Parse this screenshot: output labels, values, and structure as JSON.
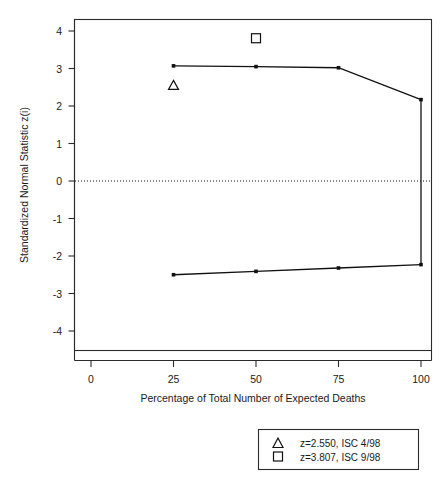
{
  "chart_data": {
    "type": "line",
    "title": "",
    "xlabel": "Percentage of Total Number of Expected Deaths",
    "ylabel": "Standardized Normal Statistic z(i)",
    "xlim": [
      -5,
      105
    ],
    "ylim": [
      -4.4,
      4.4
    ],
    "xticks": [
      0,
      25,
      50,
      75,
      100
    ],
    "xtick_labels": [
      "0",
      "25",
      "50",
      "75",
      "100"
    ],
    "yticks": [
      4,
      3,
      2,
      1,
      0,
      -1,
      -2,
      -3,
      -4
    ],
    "ytick_labels": [
      "4",
      "3",
      "2",
      "1",
      "0",
      "-1",
      "-2",
      "-3",
      "-4"
    ],
    "grid": false,
    "legend_position": "below-plot-right",
    "reference_line": {
      "name": "zero-line",
      "y": 0,
      "style": "dotted"
    },
    "series": [
      {
        "name": "Upper sequential boundary",
        "style": "line-with-points",
        "x": [
          25,
          50,
          75,
          100
        ],
        "values": [
          3.07,
          3.05,
          3.02,
          2.17
        ]
      },
      {
        "name": "Lower sequential boundary",
        "style": "line-with-points",
        "x": [
          25,
          50,
          75,
          100
        ],
        "values": [
          -2.5,
          -2.41,
          -2.32,
          -2.23
        ]
      },
      {
        "name": "Closing vertical boundary at 100%",
        "style": "vertical-connector",
        "x": [
          100,
          100
        ],
        "values": [
          2.17,
          -2.23
        ]
      }
    ],
    "annotations": [
      {
        "name": "observed-z-apr-1998",
        "marker": "triangle",
        "x": 25,
        "y": 2.55,
        "label": "z=2.550, ISC 4/98"
      },
      {
        "name": "observed-z-sep-1998",
        "marker": "square",
        "x": 50,
        "y": 3.807,
        "label": "z=3.807, ISC 9/98"
      }
    ],
    "legend": {
      "entries": [
        {
          "marker": "triangle",
          "label": "z=2.550, ISC 4/98"
        },
        {
          "marker": "square",
          "label": "z=3.807, ISC 9/98"
        }
      ]
    }
  },
  "axis": {
    "y_title": "Standardized Normal Statistic z(i)",
    "x_title": "Percentage of Total Number of Expected Deaths",
    "ytick_0": "4",
    "ytick_1": "3",
    "ytick_2": "2",
    "ytick_3": "1",
    "ytick_4": "0",
    "ytick_5": "-1",
    "ytick_6": "-2",
    "ytick_7": "-3",
    "ytick_8": "-4",
    "xtick_0": "0",
    "xtick_1": "25",
    "xtick_2": "50",
    "xtick_3": "75",
    "xtick_4": "100"
  },
  "legend": {
    "row0_label": "z=2.550, ISC 4/98",
    "row1_label": "z=3.807, ISC 9/98"
  },
  "colors": {
    "ink": "#111111",
    "axis": "#2b2b2b",
    "background": "#ffffff"
  }
}
